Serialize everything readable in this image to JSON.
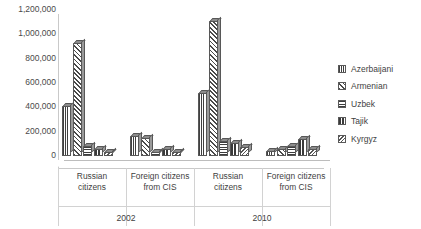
{
  "chart_data": {
    "type": "bar",
    "title": "",
    "xlabel": "",
    "ylabel": "",
    "ylim": [
      0,
      1200000
    ],
    "ytick_labels": [
      "1,200,000",
      "1,000,000",
      "800,000",
      "600,000",
      "400,000",
      "200,000",
      "0"
    ],
    "ytick_values": [
      1200000,
      1000000,
      800000,
      600000,
      400000,
      200000,
      0
    ],
    "grid": false,
    "legend_position": "right",
    "categories": [
      "Russian citizens",
      "Foreign citizens from CIS",
      "Russian citizens",
      "Foreign citizens from CIS"
    ],
    "category_lines": [
      [
        "Russian",
        "citizens"
      ],
      [
        "Foreign citizens",
        "from CIS"
      ],
      [
        "Russian",
        "citizens"
      ],
      [
        "Foreign citizens",
        "from CIS"
      ]
    ],
    "group_labels": [
      "2002",
      "2010"
    ],
    "series": [
      {
        "name": "Azerbaijani",
        "pattern": "vertical-hatch",
        "values": [
          410000,
          165000,
          515000,
          45000
        ]
      },
      {
        "name": "Armenian",
        "pattern": "diagonal-hatch",
        "values": [
          930000,
          150000,
          1110000,
          60000
        ]
      },
      {
        "name": "Uzbek",
        "pattern": "solid-dark",
        "values": [
          80000,
          35000,
          120000,
          80000
        ]
      },
      {
        "name": "Tajik",
        "pattern": "vertical-bars",
        "values": [
          55000,
          60000,
          110000,
          140000
        ]
      },
      {
        "name": "Kyrgyz",
        "pattern": "cross-hatch",
        "values": [
          35000,
          30000,
          75000,
          55000
        ]
      }
    ]
  },
  "legend": {
    "items": [
      {
        "label": "Azerbaijani"
      },
      {
        "label": "Armenian"
      },
      {
        "label": "Uzbek"
      },
      {
        "label": "Tajik"
      },
      {
        "label": "Kyrgyz"
      }
    ]
  }
}
